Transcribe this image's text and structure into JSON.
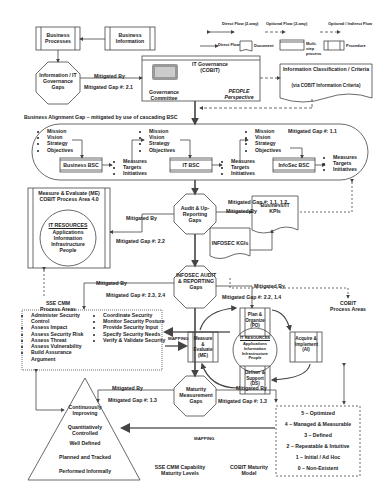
{
  "legend": {
    "direct_flow_2way": "Direct Flow (2-way)",
    "optional_flow_2way": "Optional Flow (2-way)",
    "optional_indirect_flow": "Optional / Indirect Flow",
    "direct_flow": "Direct Flow",
    "document": "Document",
    "multi_step_process": "Multi-step process",
    "procedure": "Procedure"
  },
  "top": {
    "business_processes": "Business Processes",
    "business_information": "Business Information",
    "info_it_gov_gaps": "Information / IT Governance Gaps",
    "mitigated_by": "Mitigated By",
    "mitigated_gap_21": "Mitigated Gap #: 2.1",
    "it_governance": "IT Governance (COBIT)",
    "governance_committee": "Governance Committee",
    "people_perspective": "PEOPLE Perspective",
    "info_classification": "Information Classification / Criteria",
    "via_cobit": "(via COBIT Information Criteria)"
  },
  "bsc": {
    "alignment_gap": "Business Alignment Gap – mitigated by use of cascading BSC",
    "mitigated_gap_11": "Mitigated Gap #: 1.1",
    "top_items": [
      "Mission",
      "Vision",
      "Strategy",
      "Objectives"
    ],
    "bottom_items": [
      "Measures",
      "Targets",
      "Initiatives"
    ],
    "business_bsc": "Business BSC",
    "it_bsc": "IT BSC",
    "infosec_bsc": "InfoSec BSC"
  },
  "me_box": {
    "title": "Measure & Evaluate (ME) COBIT Process Area 4.0",
    "it_resources": "IT RESOURCES",
    "resources": [
      "Applications",
      "Information",
      "Infrastructure",
      "People"
    ]
  },
  "middle": {
    "audit_gaps": "Audit & Up-Reporting Gaps",
    "mitigated_gap_111_12": "Mitigated Gap #: 1.1, 1.2",
    "mitigated_gap_22": "Mitigated Gap #: 2.2",
    "business_it_kpis": "Business/IT KPIs",
    "infosec_kgis": "INFOSEC KGIs",
    "infosec_audit_gaps": "INFOSEC AUDIT & REPORTING Gaps",
    "mitigated_gap_23_24": "Mitigated Gap #: 2.3, 2.4",
    "mitigated_gap_22_14": "Mitigated Gap #: 2.2, 1.4",
    "cobit_process_areas": "COBIT Process Areas",
    "sse_cmm_process_areas": "SSE CMM Process Areas"
  },
  "sse_list": {
    "left": [
      "Administer Security Control",
      "Assess Impact",
      "Assess Security Risk",
      "Assess Threat",
      "Assess Vulnerability",
      "Build Assurance Argument"
    ],
    "right": [
      "Coordinate Security",
      "Monitor Security Posture",
      "Provide Security Input",
      "Specify Security Needs",
      "Verify & Validate Security"
    ]
  },
  "cobit_cycle": {
    "po": "Plan & Organize (PO)",
    "ai": "Acquire & Implement (AI)",
    "ds": "Deliver & Support (DS)",
    "me": "Measure & Evaluate (ME)",
    "it_resources": "IT RESOURCES",
    "resources": "Applications Information Infrastructure People"
  },
  "bottom": {
    "mapping": "MAPPING",
    "maturity_gaps": "Maturity Measurement Gaps",
    "mitigated_gap_13": "Mitigated Gap #: 1.3",
    "pyramid": [
      "Continuously Improving",
      "Quantitatively Controlled",
      "Well Defined",
      "Planned and Tracked",
      "Performed Informally"
    ],
    "sse_cmm_levels": "SSE CMM Capability Maturity Levels",
    "cobit_maturity_model": "COBIT Maturity Model",
    "cobit_levels": [
      "5 – Optimized",
      "4 – Managed & Measurable",
      "3 – Defined",
      "2 – Repeatable & Intuitive",
      "1 – Initial / Ad Hoc",
      "0 – Non-Existent"
    ]
  }
}
